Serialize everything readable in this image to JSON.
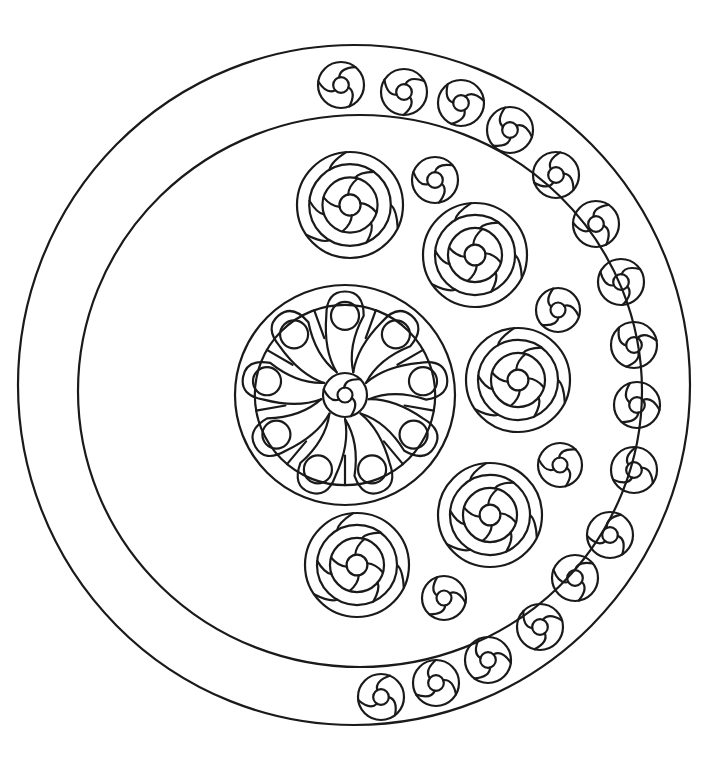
{
  "artwork": {
    "kind": "coloring-page",
    "subject": "crescent mandala with swirl rosettes",
    "stroke_color": "#1a1a1a",
    "background_color": "#ffffff",
    "outer_ring": {
      "cx": 354,
      "cy": 385,
      "rx": 336,
      "ry": 340
    },
    "inner_ring": {
      "cx": 360,
      "cy": 391,
      "rx": 282,
      "ry": 276
    },
    "center_flower": {
      "cx": 345,
      "cy": 395,
      "r": 110,
      "petals": 9
    },
    "large_rosettes": [
      {
        "cx": 350,
        "cy": 205,
        "r": 53
      },
      {
        "cx": 475,
        "cy": 255,
        "r": 52
      },
      {
        "cx": 518,
        "cy": 380,
        "r": 52
      },
      {
        "cx": 490,
        "cy": 515,
        "r": 52
      },
      {
        "cx": 357,
        "cy": 565,
        "r": 52
      }
    ],
    "small_swirls_inner": [
      {
        "cx": 435,
        "cy": 180,
        "r": 23
      },
      {
        "cx": 558,
        "cy": 310,
        "r": 22
      },
      {
        "cx": 560,
        "cy": 465,
        "r": 22
      },
      {
        "cx": 444,
        "cy": 598,
        "r": 22
      }
    ],
    "small_swirls_band": [
      {
        "cx": 341,
        "cy": 85
      },
      {
        "cx": 404,
        "cy": 92
      },
      {
        "cx": 461,
        "cy": 103
      },
      {
        "cx": 510,
        "cy": 130
      },
      {
        "cx": 556,
        "cy": 175
      },
      {
        "cx": 596,
        "cy": 224
      },
      {
        "cx": 621,
        "cy": 282
      },
      {
        "cx": 634,
        "cy": 345
      },
      {
        "cx": 637,
        "cy": 405
      },
      {
        "cx": 634,
        "cy": 470
      },
      {
        "cx": 610,
        "cy": 535
      },
      {
        "cx": 575,
        "cy": 578
      },
      {
        "cx": 540,
        "cy": 627
      },
      {
        "cx": 488,
        "cy": 660
      },
      {
        "cx": 436,
        "cy": 683
      },
      {
        "cx": 381,
        "cy": 697
      }
    ],
    "band_swirl_radius": 23
  }
}
